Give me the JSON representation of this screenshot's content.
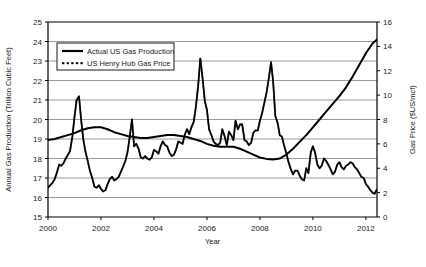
{
  "chart_data": {
    "type": "line",
    "title": "",
    "xlabel": "Year",
    "ylabel": "Annual Gas Production (Trillion Cubic Feet)",
    "y2label": "Gas Price ($US/mcf)",
    "xlim": [
      2000,
      2012.42
    ],
    "ylim": [
      15,
      25
    ],
    "y2lim": [
      0,
      16
    ],
    "xticks": [
      2000,
      2002,
      2004,
      2006,
      2008,
      2010,
      2012
    ],
    "xticklabels": [
      "2000",
      "2002",
      "2004",
      "2006",
      "2008",
      "2010",
      "2012"
    ],
    "yticks": [
      15,
      16,
      17,
      18,
      19,
      20,
      21,
      22,
      23,
      24,
      25
    ],
    "yticklabels": [
      "15",
      "16",
      "17",
      "18",
      "19",
      "20",
      "21",
      "22",
      "23",
      "24",
      "25"
    ],
    "y2ticks": [
      0,
      2,
      4,
      6,
      8,
      10,
      12,
      14,
      16
    ],
    "y2ticklabels": [
      "0",
      "2",
      "4",
      "6",
      "8",
      "10",
      "12",
      "14",
      "16"
    ],
    "grid": "horizontal",
    "legend_position": "upper-left-inside",
    "series": [
      {
        "name": "Actual US Gas Production",
        "axis": "left",
        "style": "solid",
        "color": "#000000",
        "units": "Trillion Cubic Feet",
        "x": [
          2000.0,
          2000.25,
          2000.5,
          2000.75,
          2001.0,
          2001.25,
          2001.5,
          2001.75,
          2002.0,
          2002.25,
          2002.5,
          2002.75,
          2003.0,
          2003.25,
          2003.5,
          2003.75,
          2004.0,
          2004.25,
          2004.5,
          2004.75,
          2005.0,
          2005.25,
          2005.5,
          2005.75,
          2006.0,
          2006.25,
          2006.5,
          2006.75,
          2007.0,
          2007.25,
          2007.5,
          2007.75,
          2008.0,
          2008.25,
          2008.5,
          2008.75,
          2009.0,
          2009.25,
          2009.5,
          2009.75,
          2010.0,
          2010.25,
          2010.5,
          2010.75,
          2011.0,
          2011.25,
          2011.5,
          2011.75,
          2012.0,
          2012.25,
          2012.42
        ],
        "y": [
          18.95,
          19.0,
          19.1,
          19.2,
          19.3,
          19.45,
          19.55,
          19.6,
          19.6,
          19.5,
          19.35,
          19.25,
          19.15,
          19.1,
          19.05,
          19.05,
          19.1,
          19.15,
          19.2,
          19.2,
          19.15,
          19.1,
          19.0,
          18.9,
          18.75,
          18.65,
          18.6,
          18.6,
          18.6,
          18.5,
          18.35,
          18.2,
          18.05,
          17.98,
          17.95,
          18.0,
          18.2,
          18.5,
          18.85,
          19.2,
          19.6,
          20.0,
          20.4,
          20.8,
          21.2,
          21.65,
          22.2,
          22.8,
          23.4,
          23.9,
          24.1
        ]
      },
      {
        "name": "US Henry Hub Gas Price",
        "axis": "right",
        "style": "dotted",
        "color": "#000000",
        "units": "$US/mcf",
        "x": [
          2000.0,
          2000.08,
          2000.17,
          2000.25,
          2000.33,
          2000.42,
          2000.5,
          2000.58,
          2000.67,
          2000.75,
          2000.83,
          2000.92,
          2001.0,
          2001.08,
          2001.17,
          2001.25,
          2001.33,
          2001.42,
          2001.5,
          2001.58,
          2001.67,
          2001.75,
          2001.83,
          2001.92,
          2002.0,
          2002.08,
          2002.17,
          2002.25,
          2002.33,
          2002.42,
          2002.5,
          2002.58,
          2002.67,
          2002.75,
          2002.83,
          2002.92,
          2003.0,
          2003.08,
          2003.17,
          2003.25,
          2003.33,
          2003.42,
          2003.5,
          2003.58,
          2003.67,
          2003.75,
          2003.83,
          2003.92,
          2004.0,
          2004.08,
          2004.17,
          2004.25,
          2004.33,
          2004.42,
          2004.5,
          2004.58,
          2004.67,
          2004.75,
          2004.83,
          2004.92,
          2005.0,
          2005.08,
          2005.17,
          2005.25,
          2005.33,
          2005.42,
          2005.5,
          2005.58,
          2005.67,
          2005.75,
          2005.83,
          2005.92,
          2006.0,
          2006.08,
          2006.17,
          2006.25,
          2006.33,
          2006.42,
          2006.5,
          2006.58,
          2006.67,
          2006.75,
          2006.83,
          2006.92,
          2007.0,
          2007.08,
          2007.17,
          2007.25,
          2007.33,
          2007.42,
          2007.5,
          2007.58,
          2007.67,
          2007.75,
          2007.83,
          2007.92,
          2008.0,
          2008.08,
          2008.17,
          2008.25,
          2008.33,
          2008.42,
          2008.5,
          2008.58,
          2008.67,
          2008.75,
          2008.83,
          2008.92,
          2009.0,
          2009.08,
          2009.17,
          2009.25,
          2009.33,
          2009.42,
          2009.5,
          2009.58,
          2009.67,
          2009.75,
          2009.83,
          2009.92,
          2010.0,
          2010.08,
          2010.17,
          2010.25,
          2010.33,
          2010.42,
          2010.5,
          2010.58,
          2010.67,
          2010.75,
          2010.83,
          2010.92,
          2011.0,
          2011.08,
          2011.17,
          2011.25,
          2011.33,
          2011.42,
          2011.5,
          2011.58,
          2011.67,
          2011.75,
          2011.83,
          2011.92,
          2012.0,
          2012.08,
          2012.17,
          2012.25,
          2012.33,
          2012.42
        ],
        "y": [
          2.4,
          2.6,
          2.8,
          3.1,
          3.6,
          4.3,
          4.2,
          4.4,
          4.8,
          5.1,
          5.4,
          6.6,
          8.2,
          9.6,
          9.9,
          8.0,
          6.4,
          5.3,
          4.6,
          3.8,
          3.2,
          2.5,
          2.4,
          2.6,
          2.3,
          2.1,
          2.2,
          2.7,
          3.1,
          3.3,
          3.0,
          3.1,
          3.3,
          3.7,
          4.1,
          4.6,
          5.3,
          6.5,
          8.0,
          5.8,
          6.0,
          5.6,
          4.9,
          4.8,
          5.0,
          4.8,
          4.7,
          4.9,
          5.5,
          5.4,
          5.2,
          5.8,
          6.2,
          5.9,
          5.8,
          5.3,
          5.0,
          5.1,
          5.5,
          6.2,
          6.1,
          6.0,
          6.8,
          7.2,
          6.8,
          7.4,
          7.8,
          9.0,
          10.8,
          13.0,
          11.5,
          9.5,
          8.8,
          7.2,
          6.7,
          6.2,
          6.0,
          5.9,
          6.1,
          7.2,
          6.6,
          5.9,
          7.0,
          6.7,
          6.3,
          7.9,
          7.2,
          7.6,
          7.6,
          6.3,
          6.2,
          5.9,
          6.1,
          6.9,
          7.1,
          7.1,
          7.9,
          8.5,
          9.4,
          10.2,
          11.3,
          12.7,
          11.1,
          8.3,
          7.7,
          6.7,
          6.6,
          5.8,
          5.2,
          4.5,
          3.9,
          3.5,
          3.8,
          3.8,
          3.4,
          3.1,
          3.0,
          4.0,
          3.6,
          5.3,
          5.8,
          5.3,
          4.3,
          4.0,
          4.2,
          4.8,
          4.6,
          4.3,
          3.9,
          3.5,
          3.7,
          4.3,
          4.5,
          4.1,
          3.9,
          4.2,
          4.3,
          4.5,
          4.4,
          4.1,
          3.9,
          3.6,
          3.3,
          3.2,
          2.7,
          2.5,
          2.2,
          2.0,
          1.9,
          2.3
        ]
      }
    ]
  },
  "legend": {
    "entries": [
      {
        "label": "Actual US Gas Production",
        "marker": "solid-line"
      },
      {
        "label": "US Henry Hub Gas Price",
        "marker": "dotted-line"
      }
    ]
  },
  "colors": {
    "line": "#000000",
    "grid": "#808080",
    "axis": "#000000",
    "background": "#ffffff"
  }
}
